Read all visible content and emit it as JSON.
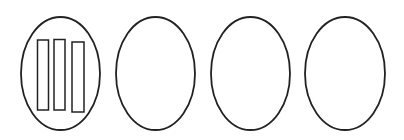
{
  "canvas": {
    "width": 404,
    "height": 140,
    "background": "#ffffff"
  },
  "stroke": {
    "color": "#222222",
    "width": 1.8
  },
  "ellipses": [
    {
      "id": "ellipse-1",
      "cx": 60.5,
      "cy": 73.5,
      "rx": 39.5,
      "ry": 56.5
    },
    {
      "id": "ellipse-2",
      "cx": 155.5,
      "cy": 73.5,
      "rx": 39.5,
      "ry": 56.5
    },
    {
      "id": "ellipse-3",
      "cx": 250.5,
      "cy": 73.5,
      "rx": 39.5,
      "ry": 56.5
    },
    {
      "id": "ellipse-4",
      "cx": 345,
      "cy": 73.5,
      "rx": 40,
      "ry": 56.5
    }
  ],
  "bars_in_first_ellipse": [
    {
      "id": "bar-1",
      "x": 37.5,
      "y": 40,
      "width": 11,
      "height": 70
    },
    {
      "id": "bar-2",
      "x": 54,
      "y": 39.5,
      "width": 11,
      "height": 70.5
    },
    {
      "id": "bar-3",
      "x": 72,
      "y": 42,
      "width": 12,
      "height": 70
    }
  ]
}
